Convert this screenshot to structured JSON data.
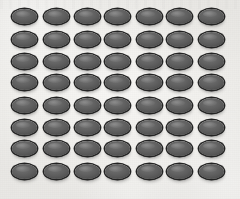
{
  "image": {
    "kind": "photograph",
    "subject": "regular rectangular array of identical dark grey elliptical disc-shaped objects on a light paper background",
    "width": 240,
    "height": 199
  },
  "background": {
    "name": "paper-backdrop",
    "color": "#f2f1ef",
    "highlight_color": "#f7f6f4",
    "shadow_color": "#e9e8e5",
    "texture": "fine scan noise with faint mottling"
  },
  "object": {
    "name": "elliptical disc",
    "shape": "ellipse",
    "face_color": "#656565",
    "rim_color": "#232323",
    "highlight_color": "#ffffff",
    "shadow_color": "#282828",
    "width_px": 25,
    "height_px": 15
  },
  "grid": {
    "columns": 7,
    "rows": 8,
    "count": 56,
    "column_pitch_px": 31,
    "row_pitch_px": 22,
    "origin_x_px": 12,
    "origin_y_px": 9,
    "row_offsets_px": [
      0,
      1,
      1,
      0,
      1,
      1,
      0,
      1
    ],
    "column_offsets_px": [
      0,
      1,
      1,
      0,
      1,
      0,
      1
    ],
    "column_indices": [
      0,
      1,
      2,
      3,
      4,
      5,
      6
    ],
    "row_indices": [
      0,
      1,
      2,
      3,
      4,
      5,
      6,
      7
    ]
  }
}
